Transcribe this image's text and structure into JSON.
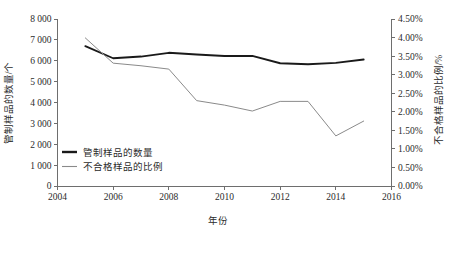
{
  "chart_data": {
    "type": "line",
    "title": "",
    "xlabel": "年份",
    "ylabel": "管制样品的数量/个",
    "y2label": "不合格样品的比例/%",
    "x": [
      2005,
      2006,
      2007,
      2008,
      2009,
      2010,
      2011,
      2012,
      2013,
      2014,
      2015
    ],
    "xlim": [
      2004,
      2016
    ],
    "ylim": [
      0,
      8000
    ],
    "y2lim": [
      0.0,
      4.5
    ],
    "grid": false,
    "legend_position": "inside-bottom-left",
    "xticks": [
      "2004",
      "2006",
      "2008",
      "2010",
      "2012",
      "2014",
      "2016"
    ],
    "xtick_values": [
      2004,
      2006,
      2008,
      2010,
      2012,
      2014,
      2016
    ],
    "yticks": [
      "0",
      "1 000",
      "2 000",
      "3 000",
      "4 000",
      "5 000",
      "6 000",
      "7 000",
      "8 000"
    ],
    "ytick_values": [
      0,
      1000,
      2000,
      3000,
      4000,
      5000,
      6000,
      7000,
      8000
    ],
    "y2ticks": [
      "0.00%",
      "0.50%",
      "1.00%",
      "1.50%",
      "2.00%",
      "2.50%",
      "3.00%",
      "3.50%",
      "4.00%",
      "4.50%"
    ],
    "y2tick_values": [
      0.0,
      0.5,
      1.0,
      1.5,
      2.0,
      2.5,
      3.0,
      3.5,
      4.0,
      4.5
    ],
    "series": [
      {
        "name": "管制样品的数量",
        "axis": "left",
        "color": "#1a1a1a",
        "values": [
          6700,
          6120,
          6200,
          6380,
          6300,
          6230,
          6230,
          5880,
          5830,
          5900,
          6060
        ]
      },
      {
        "name": "不合格样品的比例",
        "axis": "right",
        "color": "#8a8a8a",
        "values": [
          3.99,
          3.31,
          3.24,
          3.15,
          2.3,
          2.18,
          2.02,
          2.28,
          2.28,
          1.35,
          1.75
        ]
      }
    ],
    "legend": [
      {
        "label": "管制样品的数量",
        "color": "#1a1a1a",
        "width": 2.4
      },
      {
        "label": "不合格样品的比例",
        "color": "#8a8a8a",
        "width": 1.1
      }
    ]
  }
}
